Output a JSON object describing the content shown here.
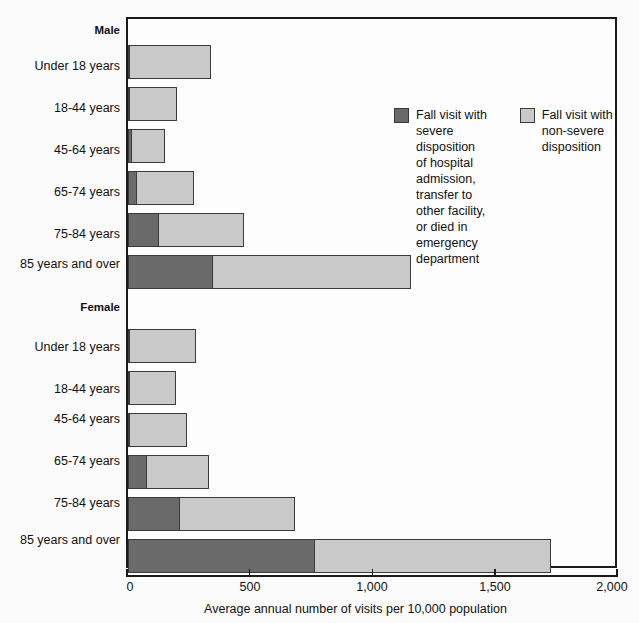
{
  "chart_data": {
    "type": "bar",
    "orientation": "horizontal",
    "stacked": true,
    "title": "",
    "xlabel": "Average annual number of visits per 10,000 population",
    "ylabel": "",
    "xlim": [
      0,
      2000
    ],
    "xticks": [
      0,
      500,
      1000,
      1500,
      2000
    ],
    "xticklabels": [
      "0",
      "500",
      "1,000",
      "1,500",
      "2,000"
    ],
    "grid": false,
    "legend_position": "inside-upper-center",
    "series": [
      {
        "name": "Fall visit with severe disposition of hospital admission, transfer to other facility, or died in emergency department",
        "color": "#6a6a6a",
        "values": [
          5,
          7,
          20,
          40,
          130,
          350,
          4,
          6,
          12,
          80,
          215,
          765
        ]
      },
      {
        "name": "Fall visit with non-severe disposition",
        "color": "#c9c9c9",
        "values": [
          335,
          198,
          136,
          235,
          350,
          810,
          276,
          194,
          233,
          255,
          470,
          965
        ]
      }
    ],
    "groups": [
      {
        "label": "Male",
        "categories": [
          "Under 18 years",
          "18-44 years",
          "45-64 years",
          "65-74 years",
          "75-84 years",
          "85 years and over"
        ],
        "severe": [
          5,
          7,
          20,
          40,
          130,
          350
        ],
        "nonsevere": [
          335,
          198,
          136,
          235,
          350,
          810
        ],
        "totals": [
          340,
          205,
          156,
          275,
          480,
          1160
        ]
      },
      {
        "label": "Female",
        "categories": [
          "Under 18 years",
          "18-44 years",
          "45-64 years",
          "65-74 years",
          "75-84 years",
          "85 years and over"
        ],
        "severe": [
          4,
          6,
          12,
          80,
          215,
          765
        ],
        "nonsevere": [
          276,
          194,
          233,
          255,
          470,
          965
        ],
        "totals": [
          280,
          200,
          245,
          335,
          685,
          1730
        ]
      }
    ]
  },
  "legend": {
    "entries": [
      {
        "swatch": "severe",
        "label": "Fall visit with\nsevere disposition\nof hospital admission,\ntransfer to other facility,\nor died in emergency\ndepartment"
      },
      {
        "swatch": "nonsevere",
        "label": "Fall visit with\nnon-severe disposition"
      }
    ]
  },
  "axis": {
    "x_title": "Average annual number of visits per 10,000 population",
    "tick_0": "0",
    "tick_1": "500",
    "tick_2": "1,000",
    "tick_3": "1,500",
    "tick_4": "2,000"
  },
  "ylabels": {
    "male_group": "Male",
    "male_0": "Under 18 years",
    "male_1": "18-44 years",
    "male_2": "45-64 years",
    "male_3": "65-74 years",
    "male_4": "75-84 years",
    "male_5": "85 years and over",
    "female_group": "Female",
    "female_0": "Under 18 years",
    "female_1": "18-44 years",
    "female_2": "45-64 years",
    "female_3": "65-74 years",
    "female_4": "75-84 years",
    "female_5": "85 years and over"
  }
}
